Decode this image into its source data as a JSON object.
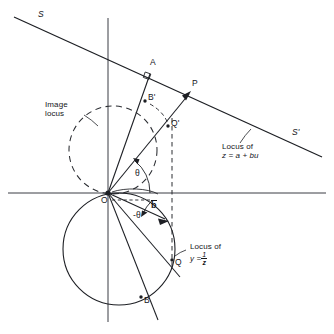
{
  "figure": {
    "background": "#ffffff",
    "ink": "#15161a",
    "width": 334,
    "height": 334
  },
  "axes": {
    "horizontal": {
      "name": "real-axis",
      "x1": 8,
      "y1": 193,
      "x2": 326,
      "y2": 193
    },
    "vertical": {
      "name": "imaginary-axis",
      "x1": 108,
      "y1": 18,
      "x2": 108,
      "y2": 320
    },
    "origin": {
      "x": 108,
      "y": 193,
      "label": "O"
    }
  },
  "line_s": {
    "name": "straight-line-s",
    "start_label": "S",
    "end_label": "S'",
    "x1": 14,
    "y1": 17,
    "x2": 322,
    "y2": 157
  },
  "circles": {
    "solid": {
      "name": "inverse-locus-circle",
      "cx": 119,
      "cy": 249,
      "r": 56
    },
    "dashed": {
      "name": "image-locus-circle",
      "cx": 113,
      "cy": 150,
      "r": 44
    }
  },
  "points": [
    {
      "id": "A",
      "label": "A",
      "x": 153,
      "y": 69,
      "dot": false
    },
    {
      "id": "Bp",
      "label": "B'",
      "x": 147,
      "y": 100,
      "dot": true
    },
    {
      "id": "P",
      "label": "P",
      "x": 193,
      "y": 90,
      "dot": false
    },
    {
      "id": "Qp",
      "label": "Q'",
      "x": 170,
      "y": 127,
      "dot": true
    },
    {
      "id": "Q",
      "label": "Q",
      "x": 173,
      "y": 262,
      "dot": true
    },
    {
      "id": "B",
      "label": "B",
      "x": 144,
      "y": 300,
      "dot": true
    },
    {
      "id": "O",
      "label": "O",
      "x": 108,
      "y": 193,
      "dot": true
    }
  ],
  "angles": {
    "theta_positive": "θ",
    "theta_negative": "-θ"
  },
  "vector_b": {
    "name": "vector-b",
    "label": "b",
    "overbar": true
  },
  "annotations": {
    "image_locus": {
      "line1": "Image",
      "line2": "locus"
    },
    "locus_z": {
      "line1": "Locus of",
      "line2": "z = a + bu"
    },
    "locus_y": {
      "line1": "Locus of",
      "line2_lead": "y =",
      "num": "1",
      "den": "z"
    }
  }
}
